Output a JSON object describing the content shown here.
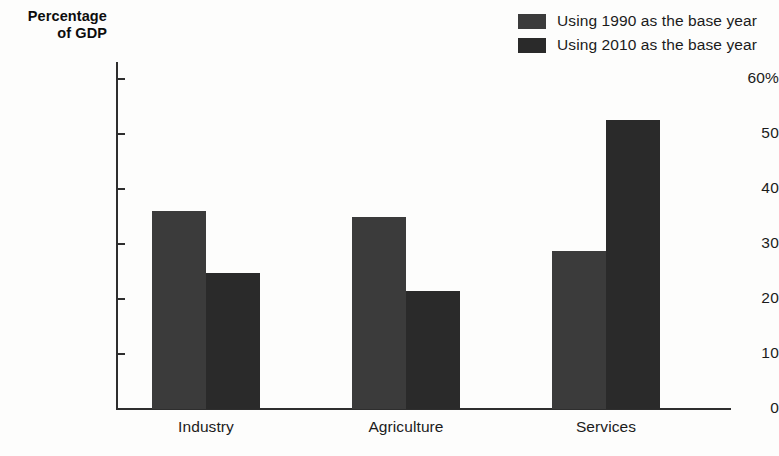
{
  "chart_data": {
    "type": "bar",
    "title": "",
    "subtitle": "",
    "xlabel": "",
    "ylabel": "Percentage of GDP",
    "ylabel_lines": [
      "Percentage",
      "of GDP"
    ],
    "categories": [
      "Industry",
      "Agriculture",
      "Services"
    ],
    "series": [
      {
        "name": "Using 1990 as the base year",
        "color": "#3b3b3b",
        "values": [
          36.0,
          35.0,
          28.7
        ]
      },
      {
        "name": "Using 2010 as the base year",
        "color": "#2a2a2a",
        "values": [
          24.8,
          21.5,
          52.5
        ]
      }
    ],
    "ylim": [
      0,
      60
    ],
    "y_ticks": [
      0,
      10,
      20,
      30,
      40,
      50,
      60
    ],
    "y_tick_labels": [
      "0",
      "10",
      "20",
      "30",
      "40",
      "50",
      "60%"
    ],
    "grid": false,
    "legend_position": "top-right"
  },
  "legend": {
    "items": [
      {
        "label": "Using 1990 as the base year",
        "color": "#3b3b3b"
      },
      {
        "label": "Using 2010 as the base year",
        "color": "#2a2a2a"
      }
    ]
  },
  "axis": {
    "y_title_line1": "Percentage",
    "y_title_line2": "of GDP",
    "tick_0": "0",
    "tick_10": "10",
    "tick_20": "20",
    "tick_30": "30",
    "tick_40": "40",
    "tick_50": "50",
    "tick_60": "60%"
  },
  "categories": {
    "c0": "Industry",
    "c1": "Agriculture",
    "c2": "Services"
  },
  "colors": {
    "series_1990": "#3b3b3b",
    "series_2010": "#2a2a2a",
    "axis": "#2e2e2e",
    "text": "#1b1b1b",
    "background": "#fdfdfc"
  }
}
